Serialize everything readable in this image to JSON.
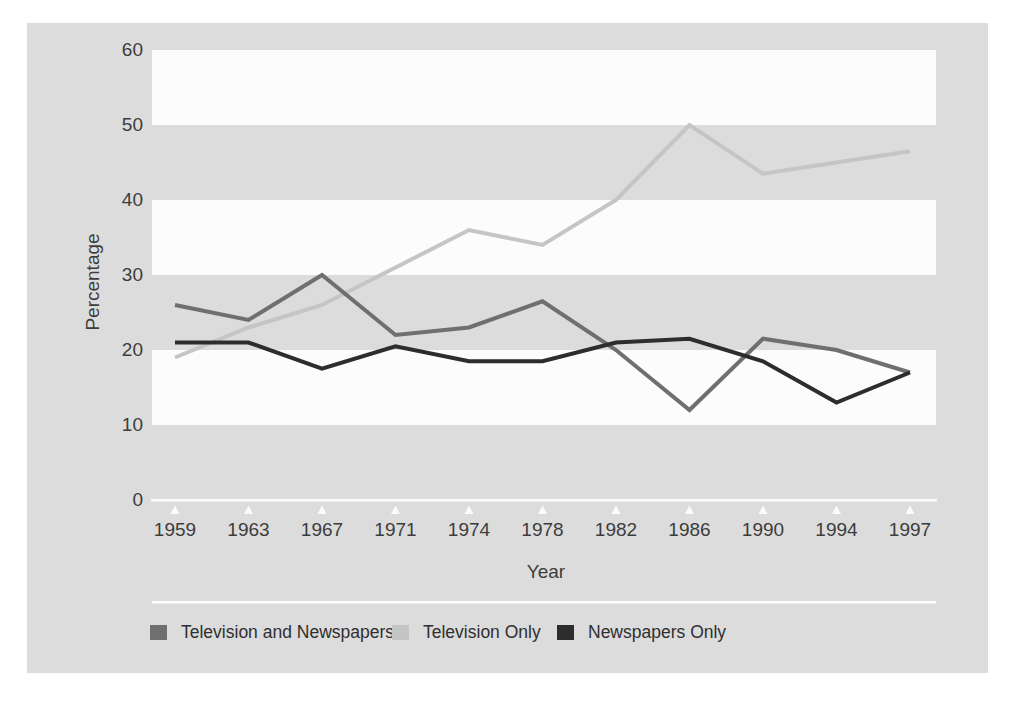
{
  "chart_data": {
    "type": "line",
    "title": "",
    "xlabel": "Year",
    "ylabel": "Percentage",
    "categories": [
      "1959",
      "1963",
      "1967",
      "1971",
      "1974",
      "1978",
      "1982",
      "1986",
      "1990",
      "1994",
      "1997"
    ],
    "y_tick_labels": [
      "60",
      "50",
      "40",
      "30",
      "20",
      "10",
      "0"
    ],
    "y_ticks": [
      60,
      50,
      40,
      30,
      20,
      10,
      0
    ],
    "ylim": [
      0,
      60
    ],
    "grid": "alternating horizontal bands (white stripes for 10-20, 30-40, 50-60 over gray panel)",
    "legend_position": "bottom",
    "series": [
      {
        "name": "Television and Newspapers",
        "color": "#6f6f6f",
        "values": [
          26,
          24,
          30,
          22,
          23,
          26.5,
          20,
          12,
          21.5,
          20,
          17
        ]
      },
      {
        "name": "Television Only",
        "color": "#c5c5c5",
        "values": [
          19,
          23,
          26,
          31,
          36,
          34,
          40,
          50,
          43.5,
          45,
          46.5
        ]
      },
      {
        "name": "Newspapers Only",
        "color": "#2d2d2d",
        "values": [
          21,
          21,
          17.5,
          20.5,
          18.5,
          18.5,
          21,
          21.5,
          18.5,
          13,
          17
        ]
      }
    ],
    "colors": {
      "panel_background": "#dcdcdc",
      "band_white": "#fcfcfc",
      "axis_line": "#fbfbfb",
      "tick_text": "#3c3c3c"
    }
  }
}
